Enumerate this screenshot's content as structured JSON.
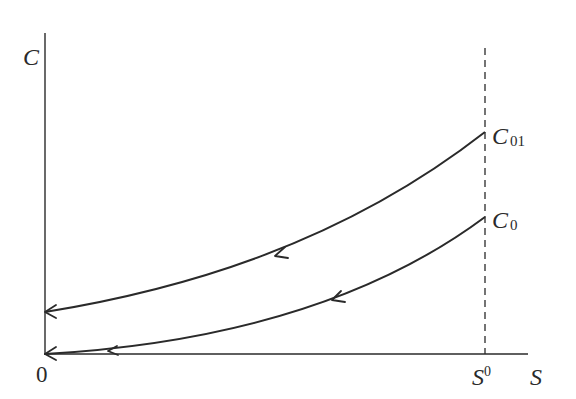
{
  "diagram": {
    "y_axis_label": "C",
    "x_axis_label": "S",
    "origin_label": "0",
    "vertical_marker": {
      "label_main": "S",
      "label_sup": "0",
      "style": "dashed"
    },
    "curves": [
      {
        "id": "upper",
        "label_main": "C",
        "label_sub": "01",
        "direction": "toward origin (right to left)"
      },
      {
        "id": "lower",
        "label_main": "C",
        "label_sub": "0",
        "direction": "toward origin (right to left)"
      }
    ],
    "colors": {
      "line": "#2a2a2a",
      "background": "#ffffff"
    }
  }
}
